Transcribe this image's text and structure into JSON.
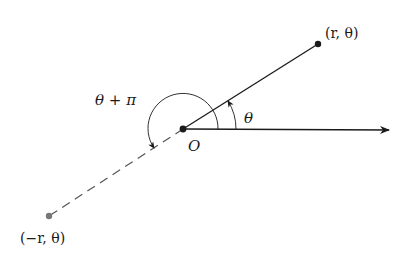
{
  "diagram": {
    "labels": {
      "point_positive": "(r, θ)",
      "point_negative": "(−r, θ)",
      "origin": "O",
      "angle_theta": "θ",
      "angle_theta_plus_pi": "θ + π"
    },
    "colors": {
      "line": "#1a1a1a",
      "negative_point": "#777777",
      "dashed_line": "#555555",
      "background": "#ffffff"
    },
    "geometry": {
      "origin": [
        183,
        129
      ],
      "point_positive": [
        318,
        44
      ],
      "point_negative": [
        49,
        216
      ],
      "axis_end": [
        389,
        130
      ]
    }
  }
}
